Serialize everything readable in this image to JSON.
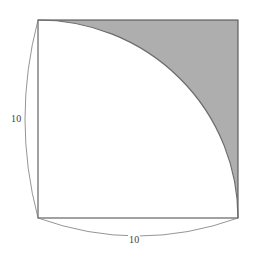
{
  "figure": {
    "square": {
      "side_length": 10,
      "x0": 38,
      "y0": 20,
      "x1": 238,
      "y1": 218,
      "stroke_color": "#555555",
      "fill_color": "#ffffff"
    },
    "arc": {
      "name": "quarter-circle-arc",
      "center_vertex": "bottom-left",
      "radius": 10,
      "start_point": "top-left",
      "end_point": "bottom-right",
      "stroke_color": "#6b6b6b"
    },
    "shaded_region": {
      "name": "shaded-corner-region",
      "location": "top-right",
      "fill_color": "#aeaeae",
      "description": "Area of the square outside the quarter circle"
    },
    "dimensions": [
      {
        "name": "left-side-dimension",
        "label": "10",
        "side": "left",
        "orientation": "vertical",
        "arc_bulge": "outward-left",
        "stroke_color": "#7a7a7a"
      },
      {
        "name": "bottom-side-dimension",
        "label": "10",
        "side": "bottom",
        "orientation": "horizontal",
        "arc_bulge": "outward-down",
        "stroke_color": "#7a7a7a"
      }
    ],
    "colors": {
      "background": "#ffffff",
      "shade": "#aeaeae",
      "outline": "#555555",
      "arc": "#6b6b6b",
      "dimension": "#7a7a7a",
      "text": "#3c3c3c"
    }
  }
}
